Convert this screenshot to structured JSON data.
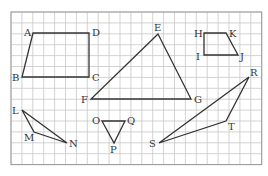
{
  "grid": {
    "x0": 11,
    "y0": 12,
    "cols": 23,
    "rows": 14,
    "cell": 10.9,
    "line_color": "#c8c8c8",
    "border_color": "#999999"
  },
  "stroke_color": "#333333",
  "shapes": [
    {
      "name": "quadrilateral-ABCD",
      "points": [
        [
          33,
          33
        ],
        [
          89,
          33
        ],
        [
          89,
          77
        ],
        [
          22,
          77
        ]
      ],
      "labels": [
        {
          "t": "A",
          "x": 24,
          "y": 36
        },
        {
          "t": "D",
          "x": 92,
          "y": 36
        },
        {
          "t": "C",
          "x": 92,
          "y": 81
        },
        {
          "t": "B",
          "x": 12,
          "y": 81
        }
      ]
    },
    {
      "name": "triangle-EFG",
      "points": [
        [
          158,
          34
        ],
        [
          91,
          99
        ],
        [
          191,
          99
        ]
      ],
      "labels": [
        {
          "t": "E",
          "x": 154,
          "y": 31
        },
        {
          "t": "F",
          "x": 81,
          "y": 103
        },
        {
          "t": "G",
          "x": 194,
          "y": 103
        }
      ]
    },
    {
      "name": "quadrilateral-HKJI",
      "points": [
        [
          204,
          33
        ],
        [
          226,
          33
        ],
        [
          238,
          55
        ],
        [
          204,
          55
        ]
      ],
      "labels": [
        {
          "t": "H",
          "x": 194,
          "y": 37
        },
        {
          "t": "K",
          "x": 229,
          "y": 37
        },
        {
          "t": "J",
          "x": 240,
          "y": 60
        },
        {
          "t": "I",
          "x": 196,
          "y": 60
        }
      ]
    },
    {
      "name": "triangle-RST",
      "points": [
        [
          249,
          77
        ],
        [
          159,
          143
        ],
        [
          226,
          121
        ]
      ],
      "labels": [
        {
          "t": "R",
          "x": 250,
          "y": 76
        },
        {
          "t": "S",
          "x": 149,
          "y": 147
        },
        {
          "t": "T",
          "x": 228,
          "y": 130
        }
      ]
    },
    {
      "name": "triangle-LMN",
      "points": [
        [
          22,
          110
        ],
        [
          34,
          132
        ],
        [
          67,
          143
        ]
      ],
      "labels": [
        {
          "t": "L",
          "x": 12,
          "y": 114
        },
        {
          "t": "M",
          "x": 24,
          "y": 141
        },
        {
          "t": "N",
          "x": 69,
          "y": 147
        }
      ]
    },
    {
      "name": "triangle-OPQ",
      "points": [
        [
          102,
          121
        ],
        [
          125,
          121
        ],
        [
          114,
          143
        ]
      ],
      "labels": [
        {
          "t": "O",
          "x": 92,
          "y": 124
        },
        {
          "t": "Q",
          "x": 127,
          "y": 124
        },
        {
          "t": "P",
          "x": 110,
          "y": 153
        }
      ]
    }
  ]
}
